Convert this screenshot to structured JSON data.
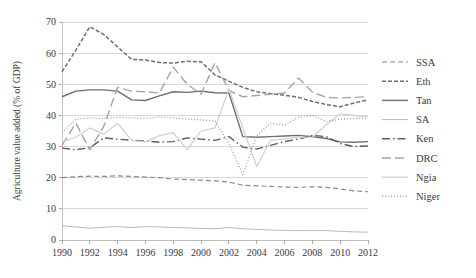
{
  "chart_data": {
    "type": "line",
    "title": "",
    "xlabel": "",
    "ylabel": "Agriculture value added (% of GDP)",
    "xlim": [
      1990,
      2012
    ],
    "ylim": [
      0,
      70
    ],
    "ytick_step": 10,
    "yticks": [
      "0",
      "10",
      "20",
      "30",
      "40",
      "50",
      "60",
      "70"
    ],
    "xticks": [
      "1990",
      "1992",
      "1994",
      "1996",
      "1998",
      "2000",
      "2002",
      "2004",
      "2006",
      "2008",
      "2010",
      "2012"
    ],
    "x": [
      1990,
      1991,
      1992,
      1993,
      1994,
      1995,
      1996,
      1997,
      1998,
      1999,
      2000,
      2001,
      2002,
      2003,
      2004,
      2005,
      2006,
      2007,
      2008,
      2009,
      2010,
      2011,
      2012
    ],
    "grid": "horizontal",
    "legend_position": "right",
    "series": [
      {
        "name": "SSA",
        "color": "#8a8a8a",
        "dash": "5,3",
        "width": 1.2,
        "values": [
          20.0,
          20.3,
          20.5,
          20.4,
          20.6,
          20.4,
          20.2,
          20.0,
          19.6,
          19.4,
          19.2,
          19.0,
          18.6,
          17.6,
          17.4,
          17.2,
          17.0,
          16.9,
          17.1,
          16.9,
          16.4,
          15.8,
          15.5
        ]
      },
      {
        "name": "Eth",
        "color": "#6f6f6f",
        "dash": "4,2",
        "width": 1.5,
        "values": [
          54.0,
          61.0,
          68.5,
          66.0,
          62.0,
          58.0,
          57.8,
          57.0,
          56.8,
          57.4,
          57.2,
          53.0,
          51.0,
          49.0,
          47.6,
          47.0,
          46.5,
          45.8,
          44.5,
          43.5,
          42.8,
          44.0,
          45.0
        ]
      },
      {
        "name": "Tan",
        "color": "#6e6e6e",
        "dash": "none",
        "width": 1.4,
        "values": [
          46.0,
          47.8,
          48.2,
          48.2,
          47.8,
          45.0,
          44.8,
          46.3,
          47.6,
          47.4,
          47.8,
          47.3,
          47.2,
          33.2,
          33.0,
          33.2,
          33.4,
          33.6,
          33.2,
          32.6,
          31.5,
          31.4,
          31.6
        ]
      },
      {
        "name": "SA",
        "color": "#b9b9b9",
        "dash": "none",
        "width": 1.0,
        "values": [
          4.6,
          4.2,
          3.8,
          4.1,
          4.3,
          4.0,
          4.3,
          4.2,
          4.0,
          3.9,
          3.7,
          3.6,
          4.0,
          3.6,
          3.4,
          3.2,
          3.1,
          3.0,
          3.1,
          3.0,
          2.8,
          2.6,
          2.5
        ]
      },
      {
        "name": "Ken",
        "color": "#5f5f5f",
        "dash": "8,3,1.5,3",
        "width": 1.4,
        "values": [
          29.5,
          29.0,
          29.6,
          32.8,
          32.4,
          32.0,
          31.8,
          31.4,
          31.6,
          32.8,
          32.4,
          32.0,
          33.2,
          29.8,
          29.2,
          30.4,
          31.6,
          32.4,
          33.6,
          33.2,
          31.0,
          30.0,
          30.2
        ]
      },
      {
        "name": "DRC",
        "color": "#a5a5a5",
        "dash": "9,4",
        "width": 1.4,
        "values": [
          30.5,
          37.5,
          29.0,
          36.5,
          49.0,
          47.8,
          47.6,
          47.2,
          55.5,
          50.0,
          46.8,
          57.0,
          48.0,
          46.0,
          46.4,
          46.8,
          47.2,
          52.0,
          47.5,
          45.8,
          45.6,
          45.8,
          46.0
        ]
      },
      {
        "name": "Ngia",
        "color": "#cfcfcf",
        "dash": "none",
        "width": 1.2,
        "values": [
          31.5,
          33.0,
          36.0,
          34.0,
          37.5,
          32.0,
          31.5,
          33.5,
          34.5,
          29.0,
          35.0,
          36.0,
          48.5,
          36.0,
          23.5,
          32.0,
          32.5,
          33.0,
          33.0,
          37.0,
          40.5,
          40.0,
          39.5
        ]
      },
      {
        "name": "Niger",
        "color": "#9e9e9e",
        "dash": "1,2",
        "width": 1.3,
        "values": [
          34.5,
          38.8,
          39.2,
          39.0,
          39.4,
          39.2,
          39.0,
          39.6,
          39.2,
          38.8,
          38.6,
          38.2,
          31.0,
          21.0,
          33.5,
          37.5,
          36.8,
          39.5,
          40.0,
          38.0,
          38.8,
          39.0,
          39.2
        ]
      }
    ]
  },
  "legend": {
    "items": [
      {
        "label": "SSA"
      },
      {
        "label": "Eth"
      },
      {
        "label": "Tan"
      },
      {
        "label": "SA"
      },
      {
        "label": "Ken"
      },
      {
        "label": "DRC"
      },
      {
        "label": "Ngia"
      },
      {
        "label": "Niger"
      }
    ]
  }
}
